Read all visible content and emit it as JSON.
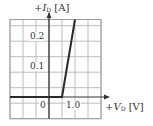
{
  "chart_data": {
    "type": "line",
    "title": "",
    "xlabel": "+V_D [V]",
    "ylabel": "+I_D [A]",
    "xlim": [
      -1.5,
      2.0
    ],
    "ylim": [
      -0.07,
      0.25
    ],
    "x_ticks": [
      {
        "value": 0,
        "label": "0"
      },
      {
        "value": 1.0,
        "label": "1.0"
      }
    ],
    "y_ticks": [
      {
        "value": 0.1,
        "label": "0.1"
      },
      {
        "value": 0.2,
        "label": "0.2"
      }
    ],
    "grid": true,
    "grid_step_x": 0.5,
    "grid_step_y": 0.05,
    "series": [
      {
        "name": "diode I-V characteristic",
        "x": [
          -1.5,
          0,
          0.5,
          1.0
        ],
        "y": [
          0,
          0,
          0,
          0.25
        ]
      }
    ],
    "colors": {
      "line": "#2a2a2a",
      "grid": "#bdbdbd",
      "axis": "#333333"
    }
  },
  "labels": {
    "y_axis": {
      "sign": "+",
      "var": "I",
      "sub": "D",
      "unit": "[A]"
    },
    "x_axis": {
      "sign": "+",
      "var": "V",
      "sub": "D",
      "unit": "[V]"
    },
    "tick_x0": "0",
    "tick_x1": "1.0",
    "tick_y1": "0.1",
    "tick_y2": "0.2"
  }
}
